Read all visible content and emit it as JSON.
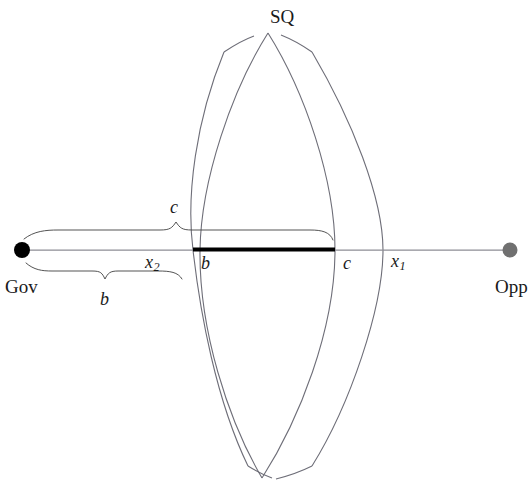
{
  "figure": {
    "title_top_cropped": "",
    "caption_bottom_cropped": "",
    "background_color": "#ffffff",
    "line_color": "#6e6e78",
    "thick_segment_color": "#000000",
    "text_color": "#1a1a1a"
  },
  "axis": {
    "left_endpoint_label": "Gov",
    "right_endpoint_label": "Opp",
    "left_dot_color": "#000000",
    "right_dot_color": "#707070"
  },
  "lens": {
    "status_quo_label": "SQ"
  },
  "labels": {
    "c_above_line": "c",
    "x2_on_line": "x",
    "x2_subscript": "2",
    "b_on_line": "b",
    "c_on_line": "c",
    "x1_on_line": "x",
    "x1_subscript": "1",
    "b_under_brace": "b"
  },
  "geometry": {
    "axis_y": 250,
    "gov_x": 22,
    "opp_x": 510,
    "thick_segment_start_x": 193,
    "thick_segment_end_x": 335,
    "outer_lens_left_x": 193,
    "outer_lens_right_x": 383,
    "inner_lens_left_x": 200,
    "inner_lens_right_x": 335,
    "upper_brace_left_x": 24,
    "upper_brace_right_x": 332,
    "upper_brace_peak_x": 176,
    "lower_brace_left_x": 26,
    "lower_brace_right_x": 183,
    "lower_brace_peak_x": 105
  }
}
